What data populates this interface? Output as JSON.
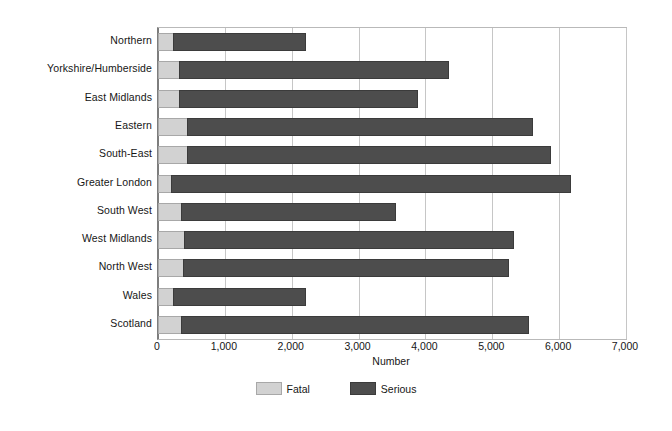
{
  "chart_data": {
    "type": "bar",
    "orientation": "horizontal",
    "stacked": true,
    "title": "",
    "xlabel": "Number",
    "ylabel": "",
    "xlim": [
      0,
      7000
    ],
    "xticks": [
      0,
      1000,
      2000,
      3000,
      4000,
      5000,
      6000,
      7000
    ],
    "xtick_labels": [
      "0",
      "1,000",
      "2,000",
      "3,000",
      "4,000",
      "5,000",
      "6,000",
      "7,000"
    ],
    "grid": true,
    "legend_position": "bottom-center",
    "categories": [
      "Northern",
      "Yorkshire/Humberside",
      "East Midlands",
      "Eastern",
      "South-East",
      "Greater London",
      "South West",
      "West Midlands",
      "North West",
      "Wales",
      "Scotland"
    ],
    "series": [
      {
        "name": "Fatal",
        "color": "#d2d2d2",
        "values": [
          220,
          315,
          315,
          435,
          435,
          195,
          345,
          390,
          375,
          225,
          345
        ]
      },
      {
        "name": "Serious",
        "color": "#4d4d4d",
        "values": [
          1990,
          4035,
          3570,
          5170,
          5440,
          5980,
          3210,
          4930,
          4870,
          1985,
          5200
        ]
      }
    ],
    "totals": [
      2210,
      4350,
      3885,
      5605,
      5875,
      6175,
      3555,
      5320,
      5245,
      2210,
      5545
    ]
  },
  "legend": {
    "items": [
      {
        "label": "Fatal",
        "swatch": "fatal"
      },
      {
        "label": "Serious",
        "swatch": "serious"
      }
    ]
  },
  "axis": {
    "x_title": "Number"
  },
  "colors": {
    "fatal": "#d2d2d2",
    "serious": "#4d4d4d",
    "gridline": "#c6c6c6",
    "axis": "#7d7d7d",
    "plot_border": "#b9b9b9",
    "text": "#161616",
    "background": "#ffffff"
  }
}
